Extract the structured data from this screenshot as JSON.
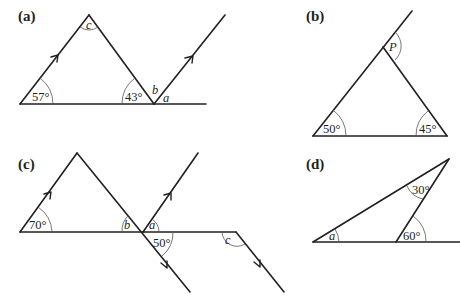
{
  "diagrams": {
    "a": {
      "label": "(a)",
      "angles": {
        "bottom_left": "57°",
        "bottom_right": "43°",
        "apex": "c",
        "b": "b",
        "a": "a"
      }
    },
    "b": {
      "label": "(b)",
      "angles": {
        "bottom_left": "50°",
        "bottom_right": "45°",
        "exterior": "P"
      }
    },
    "c": {
      "label": "(c)",
      "angles": {
        "bottom_left": "70°",
        "b": "b",
        "a": "a",
        "below": "50°",
        "c": "c"
      }
    },
    "d": {
      "label": "(d)",
      "angles": {
        "a": "a",
        "top": "30°",
        "exterior": "60°"
      }
    }
  },
  "colors": {
    "line": "#231f20",
    "arc": "#555555",
    "background": "#ffffff"
  }
}
